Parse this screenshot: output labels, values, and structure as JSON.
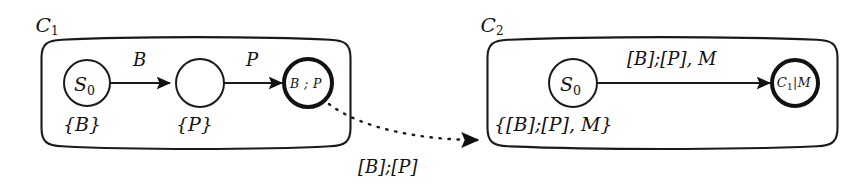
{
  "diagram": {
    "background_color": "#ffffff",
    "ink_color": "#1a1a1a",
    "containers": [
      {
        "id": "c1",
        "label_base": "C",
        "label_sub": "1",
        "alphabet_labels": [
          {
            "id": "c1-alpha-b",
            "text": "{B}"
          },
          {
            "id": "c1-alpha-p",
            "text": "{P}"
          }
        ],
        "states": [
          {
            "id": "c1-s0",
            "label_base": "S",
            "label_sub": "0",
            "accepting": false
          },
          {
            "id": "c1-s1",
            "label_base": "",
            "label_sub": "",
            "accepting": false
          },
          {
            "id": "c1-s2",
            "label_base": "B ; P",
            "label_sub": "",
            "accepting": true
          }
        ],
        "transitions": [
          {
            "id": "c1-t1",
            "label": "B"
          },
          {
            "id": "c1-t2",
            "label": "P"
          }
        ]
      },
      {
        "id": "c2",
        "label_base": "C",
        "label_sub": "2",
        "alphabet_labels": [
          {
            "id": "c2-alpha",
            "text": "{[B];[P], M}"
          }
        ],
        "states": [
          {
            "id": "c2-s0",
            "label_base": "S",
            "label_sub": "0",
            "accepting": false
          },
          {
            "id": "c2-s1",
            "label_base": "C",
            "label_sub": "1",
            "label_suffix": "|M",
            "accepting": true
          }
        ],
        "transitions": [
          {
            "id": "c2-t1",
            "label": "[B];[P], M"
          }
        ]
      }
    ],
    "link": {
      "id": "refinement-link",
      "label": "[B];[P]",
      "style": "dashed",
      "arrow": "filled-triangle"
    }
  }
}
